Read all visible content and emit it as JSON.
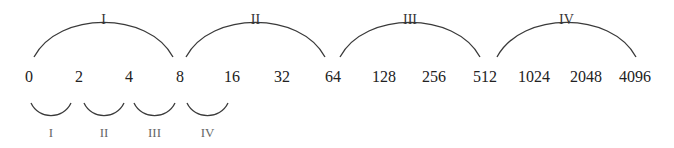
{
  "diagram": {
    "numbers": [
      {
        "label": "0",
        "x": 29
      },
      {
        "label": "2",
        "x": 79
      },
      {
        "label": "4",
        "x": 129
      },
      {
        "label": "8",
        "x": 180
      },
      {
        "label": "16",
        "x": 232
      },
      {
        "label": "32",
        "x": 282
      },
      {
        "label": "64",
        "x": 333
      },
      {
        "label": "128",
        "x": 384
      },
      {
        "label": "256",
        "x": 434
      },
      {
        "label": "512",
        "x": 485
      },
      {
        "label": "1024",
        "x": 534
      },
      {
        "label": "2048",
        "x": 586
      },
      {
        "label": "4096",
        "x": 635
      }
    ],
    "top_arcs": [
      {
        "label": "I",
        "x1": 34,
        "x2": 173
      },
      {
        "label": "II",
        "x1": 186,
        "x2": 325
      },
      {
        "label": "III",
        "x1": 340,
        "x2": 480
      },
      {
        "label": "IV",
        "x1": 497,
        "x2": 636
      }
    ],
    "bottom_arcs": [
      {
        "label": "I",
        "x1": 31,
        "x2": 71
      },
      {
        "label": "II",
        "x1": 84,
        "x2": 124
      },
      {
        "label": "III",
        "x1": 134,
        "x2": 175
      },
      {
        "label": "IV",
        "x1": 187,
        "x2": 228
      }
    ],
    "colors": {
      "arc": "#3a3a3a",
      "number": "#222222",
      "top_label": "#333333",
      "bottom_label": "#666666"
    }
  }
}
